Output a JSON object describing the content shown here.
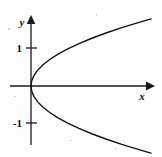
{
  "figure": {
    "background_color": "#fdfdfd",
    "ink_color": "#141414",
    "width": 162,
    "height": 157
  },
  "axes": {
    "x_axis_name": "x-axis",
    "y_axis_name": "y-axis",
    "x_label": "x",
    "y_label": "y",
    "origin_px": {
      "x": 31,
      "y": 86
    },
    "unit_px": 37.5
  },
  "ticks": {
    "y": [
      {
        "label": "1",
        "value": 1,
        "py": 48
      },
      {
        "label": "-1",
        "value": -1,
        "py": 123
      }
    ],
    "x": []
  },
  "chart_data": {
    "type": "line",
    "title": "",
    "subtitle": "",
    "xlabel": "x",
    "ylabel": "y",
    "xlim": [
      -0.6,
      3.3
    ],
    "ylim": [
      -1.8,
      1.8
    ],
    "grid": false,
    "legend": "none",
    "annotations": [],
    "equation": "x = y^2",
    "series": [
      {
        "name": "upper branch y = sqrt(x)",
        "x": [
          0.0,
          0.02,
          0.08,
          0.18,
          0.32,
          0.5,
          0.72,
          0.98,
          1.28,
          1.62,
          2.0,
          2.42,
          2.88,
          3.2
        ],
        "y": [
          0.0,
          0.141,
          0.283,
          0.424,
          0.566,
          0.707,
          0.849,
          0.99,
          1.131,
          1.273,
          1.414,
          1.556,
          1.697,
          1.789
        ]
      },
      {
        "name": "lower branch y = -sqrt(x)",
        "x": [
          0.0,
          0.02,
          0.08,
          0.18,
          0.32,
          0.5,
          0.72,
          0.98,
          1.28,
          1.62,
          2.0,
          2.42,
          2.88,
          3.2
        ],
        "y": [
          0.0,
          -0.141,
          -0.283,
          -0.424,
          -0.566,
          -0.707,
          -0.849,
          -0.99,
          -1.131,
          -1.273,
          -1.414,
          -1.556,
          -1.697,
          -1.789
        ]
      }
    ]
  }
}
